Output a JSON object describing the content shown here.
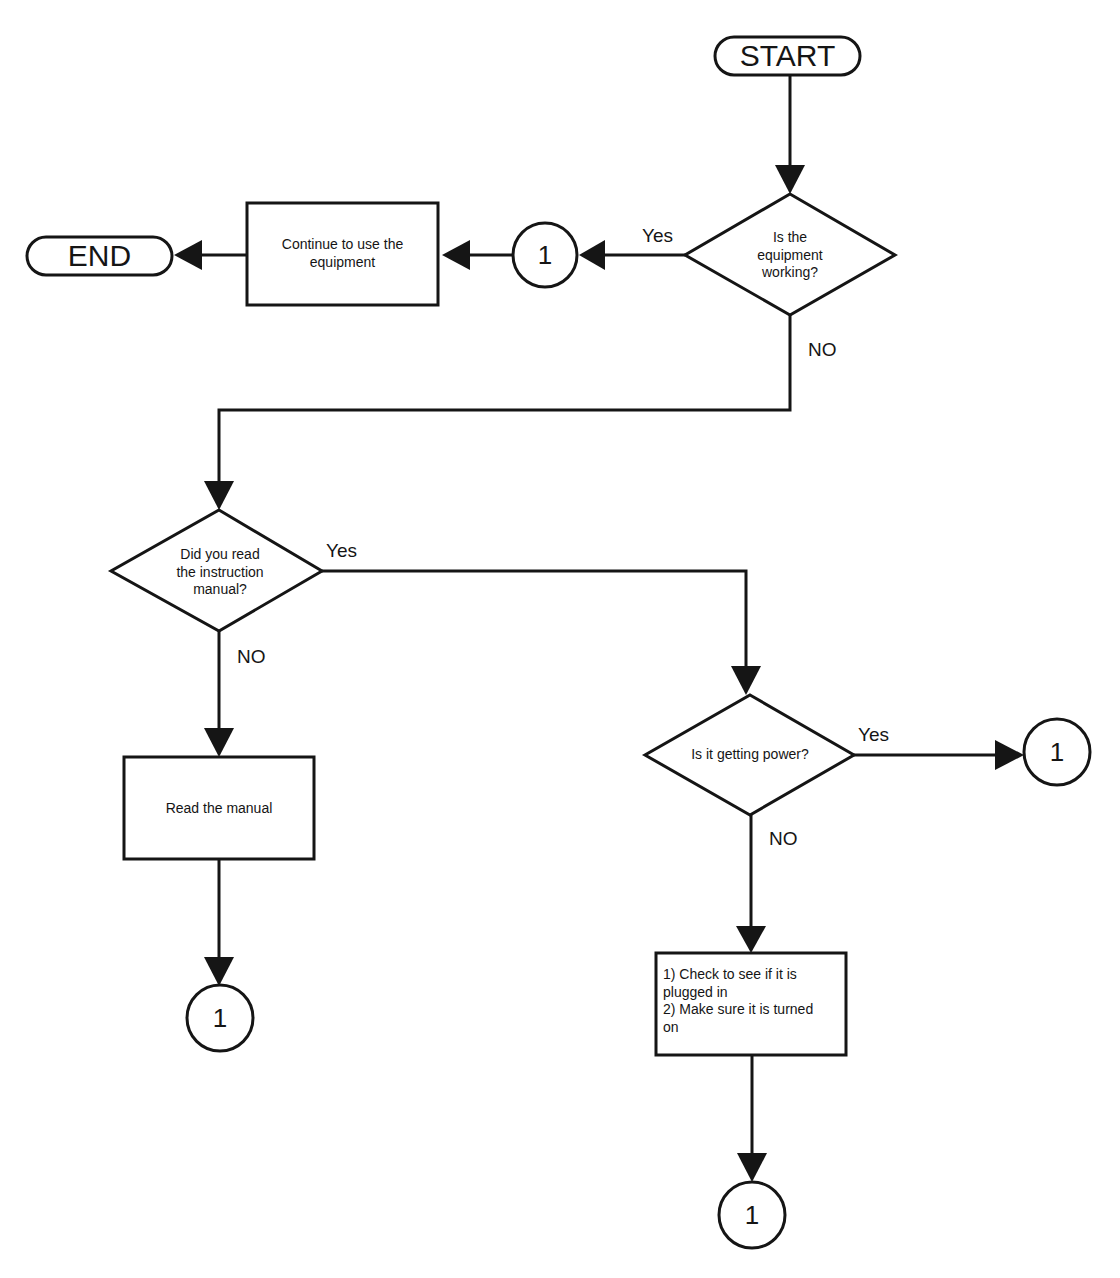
{
  "diagram": {
    "nodes": {
      "start": {
        "type": "terminator",
        "label": "START"
      },
      "end": {
        "type": "terminator",
        "label": "END"
      },
      "q_working": {
        "type": "decision",
        "label_lines": [
          "Is the",
          "equipment",
          "working?"
        ]
      },
      "continue": {
        "type": "process",
        "label_lines": [
          "Continue to use the",
          "equipment"
        ]
      },
      "q_manual": {
        "type": "decision",
        "label_lines": [
          "Did you read",
          "the instruction",
          "manual?"
        ]
      },
      "read_manual": {
        "type": "process",
        "label": "Read the manual"
      },
      "q_power": {
        "type": "decision",
        "label": "Is it getting power?"
      },
      "check_power": {
        "type": "process",
        "label_lines": [
          "1) Check to see if it is",
          "plugged  in",
          "2) Make sure it is turned",
          "on"
        ]
      },
      "connector_a": {
        "type": "connector",
        "label": "1"
      },
      "connector_b": {
        "type": "connector",
        "label": "1"
      },
      "connector_c": {
        "type": "connector",
        "label": "1"
      },
      "connector_d": {
        "type": "connector",
        "label": "1"
      }
    },
    "edge_labels": {
      "working_yes": "Yes",
      "working_no": "NO",
      "manual_yes": "Yes",
      "manual_no": "NO",
      "power_yes": "Yes",
      "power_no": "NO"
    },
    "edges": [
      {
        "from": "start",
        "to": "q_working"
      },
      {
        "from": "q_working",
        "to": "connector_a",
        "label": "Yes"
      },
      {
        "from": "connector_a",
        "to": "continue"
      },
      {
        "from": "continue",
        "to": "end"
      },
      {
        "from": "q_working",
        "to": "q_manual",
        "label": "NO"
      },
      {
        "from": "q_manual",
        "to": "q_power",
        "label": "Yes"
      },
      {
        "from": "q_manual",
        "to": "read_manual",
        "label": "NO"
      },
      {
        "from": "read_manual",
        "to": "connector_c"
      },
      {
        "from": "q_power",
        "to": "connector_b",
        "label": "Yes"
      },
      {
        "from": "q_power",
        "to": "check_power",
        "label": "NO"
      },
      {
        "from": "check_power",
        "to": "connector_d"
      }
    ],
    "colors": {
      "ink": "#151515",
      "paper": "#ffffff"
    }
  }
}
